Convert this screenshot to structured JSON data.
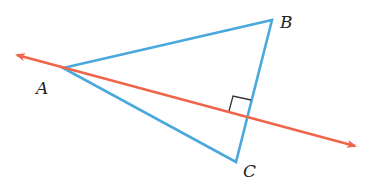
{
  "diagram": {
    "colors": {
      "triangle": "#4aa8dc",
      "line": "#f0654a",
      "marker": "#333333",
      "label": "#222222"
    },
    "vertices": [
      {
        "name": "A",
        "label": "A",
        "x": 63,
        "y": 68,
        "label_x": 36,
        "label_y": 94
      },
      {
        "name": "B",
        "label": "B",
        "x": 272,
        "y": 20,
        "label_x": 280,
        "label_y": 28
      },
      {
        "name": "C",
        "label": "C",
        "x": 236,
        "y": 162,
        "label_x": 243,
        "label_y": 177
      }
    ],
    "line": {
      "description": "Line through A perpendicular to BC",
      "start": {
        "x": 17,
        "y": 55
      },
      "end": {
        "x": 355,
        "y": 146
      },
      "arrows": "both"
    },
    "right_angle_marker": {
      "at_intersection": {
        "x": 247,
        "y": 116
      }
    }
  }
}
